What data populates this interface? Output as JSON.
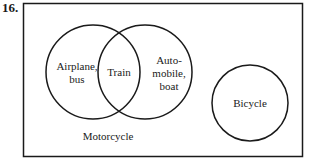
{
  "problem_number": "16.",
  "diagram": {
    "type": "venn",
    "universe_label": "Motorcycle",
    "sets": [
      {
        "id": "left",
        "label_line1": "Airplane,",
        "label_line2": "bus"
      },
      {
        "id": "right",
        "label_line1": "Auto-",
        "label_line2": "mobile,",
        "label_line3": "boat"
      },
      {
        "id": "disjoint",
        "label": "Bicycle"
      }
    ],
    "intersection_label": "Train",
    "stroke_color": "#1a1a1a"
  }
}
